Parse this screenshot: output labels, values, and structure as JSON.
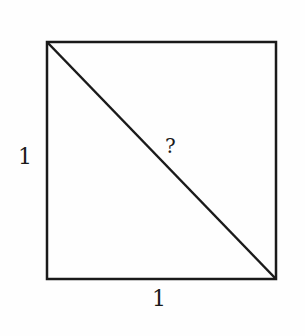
{
  "diagram": {
    "shape": "unit-square-with-diagonal",
    "left_side_label": "1",
    "bottom_side_label": "1",
    "diagonal_label": "?",
    "stroke_color": "#1a1a1a"
  }
}
